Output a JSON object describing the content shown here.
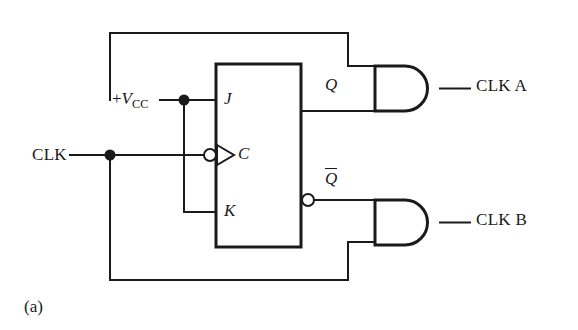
{
  "figure": {
    "caption": "(a)",
    "type": "digital-logic-schematic"
  },
  "labels": {
    "vcc_prefix": "+",
    "vcc_symbol": "V",
    "vcc_subscript": "CC",
    "clk_input": "CLK",
    "input_j": "J",
    "input_c": "C",
    "input_k": "K",
    "output_q": "Q",
    "output_qbar": "Q",
    "out_clk_a": "CLK A",
    "out_clk_b": "CLK B"
  },
  "components": {
    "flip_flop": {
      "name": "JK flip-flop",
      "inputs": [
        "J",
        "C",
        "K"
      ],
      "outputs": [
        "Q",
        "Q-bar"
      ],
      "clock_edge": "negative",
      "clock_bubble": true,
      "dynamic_indicator": true,
      "qbar_bubble": true
    },
    "and_gate_a": {
      "name": "AND gate",
      "inputs": 2,
      "output_label": "CLK A"
    },
    "and_gate_b": {
      "name": "AND gate",
      "inputs": 2,
      "output_label": "CLK B"
    },
    "junctions": [
      {
        "name": "vcc-node",
        "x": 184,
        "y": 100
      },
      {
        "name": "clk-node",
        "x": 110,
        "y": 155
      }
    ]
  },
  "colors": {
    "background": "#ffffff",
    "ink": "#1a1a1a",
    "wire": "#1a1a1a"
  }
}
